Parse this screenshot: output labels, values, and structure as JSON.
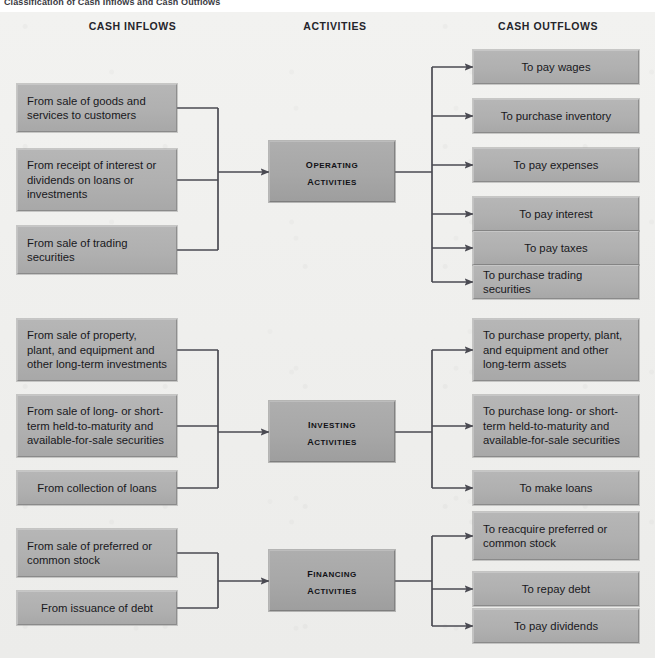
{
  "caption": "Classification of Cash Inflows and Cash Outflows",
  "headers": [
    {
      "label": "CASH INFLOWS",
      "x": 30,
      "y": 8,
      "w": 205
    },
    {
      "label": "ACTIVITIES",
      "x": 245,
      "y": 8,
      "w": 180
    },
    {
      "label": "CASH OUTFLOWS",
      "x": 448,
      "y": 8,
      "w": 200
    }
  ],
  "colors": {
    "background": "#efefed",
    "box_fill": "#b0b0b0",
    "activity_fill": "#a7a7a7",
    "wire": "#4a4a52",
    "text": "#18181c",
    "caption": "#3a3a42"
  },
  "sections": [
    {
      "name": "operating",
      "activity": {
        "line1": "Operating",
        "line2": "Activities",
        "x": 269,
        "y": 129,
        "w": 126,
        "h": 61
      },
      "bus_in_x": 218,
      "bus_out_x": 432,
      "inflows": [
        {
          "text": "From sale of goods and services to customers",
          "x": 17,
          "y": 72,
          "w": 160,
          "h": 48
        },
        {
          "text": "From receipt of interest or dividends on loans or investments",
          "x": 17,
          "y": 137,
          "w": 160,
          "h": 62
        },
        {
          "text": "From sale of trading securities",
          "x": 17,
          "y": 214,
          "w": 160,
          "h": 48
        }
      ],
      "outflows": [
        {
          "text": "To pay wages",
          "x": 473,
          "y": 38,
          "w": 166,
          "h": 34
        },
        {
          "text": "To purchase inventory",
          "x": 473,
          "y": 87,
          "w": 166,
          "h": 34
        },
        {
          "text": "To pay expenses",
          "x": 473,
          "y": 136,
          "w": 166,
          "h": 34
        },
        {
          "text": "To pay interest",
          "x": 473,
          "y": 185,
          "w": 166,
          "h": 34
        },
        {
          "text": "To pay taxes",
          "x": 473,
          "y": 219,
          "w": 166,
          "h": 34
        },
        {
          "text": "To purchase trading securities",
          "x": 473,
          "y": 253,
          "w": 166,
          "h": 34
        }
      ]
    },
    {
      "name": "investing",
      "activity": {
        "line1": "Investing",
        "line2": "Activities",
        "x": 269,
        "y": 389,
        "w": 126,
        "h": 61
      },
      "bus_in_x": 218,
      "bus_out_x": 432,
      "inflows": [
        {
          "text": "From sale of property, plant, and equipment and other long-term investments",
          "x": 17,
          "y": 307,
          "w": 160,
          "h": 62
        },
        {
          "text": "From sale of long- or short-term held-to-maturity and available-for-sale securities",
          "x": 17,
          "y": 383,
          "w": 160,
          "h": 62
        },
        {
          "text": "From collection of loans",
          "x": 17,
          "y": 459,
          "w": 160,
          "h": 34
        }
      ],
      "outflows": [
        {
          "text": "To purchase property, plant, and equipment and other long-term assets",
          "x": 473,
          "y": 307,
          "w": 166,
          "h": 62
        },
        {
          "text": "To purchase long- or short-term held-to-maturity and available-for-sale securities",
          "x": 473,
          "y": 383,
          "w": 166,
          "h": 62
        },
        {
          "text": "To make loans",
          "x": 473,
          "y": 459,
          "w": 166,
          "h": 34
        }
      ]
    },
    {
      "name": "financing",
      "activity": {
        "line1": "Financing",
        "line2": "Activities",
        "x": 269,
        "y": 538,
        "w": 126,
        "h": 61
      },
      "bus_in_x": 218,
      "bus_out_x": 432,
      "inflows": [
        {
          "text": "From sale of preferred or common stock",
          "x": 17,
          "y": 517,
          "w": 160,
          "h": 48
        },
        {
          "text": "From issuance of debt",
          "x": 17,
          "y": 579,
          "w": 160,
          "h": 34
        }
      ],
      "outflows": [
        {
          "text": "To reacquire preferred or common stock",
          "x": 473,
          "y": 500,
          "w": 166,
          "h": 48
        },
        {
          "text": "To repay debt",
          "x": 473,
          "y": 560,
          "w": 166,
          "h": 34
        },
        {
          "text": "To pay dividends",
          "x": 473,
          "y": 597,
          "w": 166,
          "h": 34
        }
      ]
    }
  ]
}
